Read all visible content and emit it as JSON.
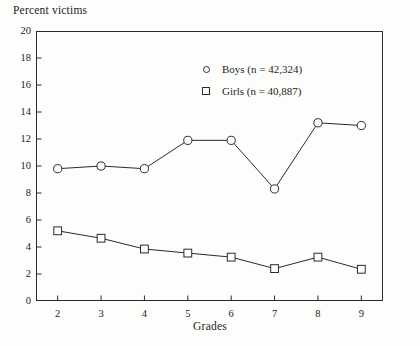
{
  "chart_data": {
    "type": "line",
    "title": "",
    "xlabel": "Grades",
    "ylabel": "Percent victims",
    "categories": [
      "2",
      "3",
      "4",
      "5",
      "6",
      "7",
      "8",
      "9"
    ],
    "x": [
      2,
      3,
      4,
      5,
      6,
      7,
      8,
      9
    ],
    "xlim": [
      1.5,
      9.5
    ],
    "ylim": [
      0,
      20
    ],
    "yticks": [
      "0",
      "2",
      "4",
      "6",
      "8",
      "10",
      "12",
      "14",
      "16",
      "18",
      "20"
    ],
    "ytick_values": [
      0,
      2,
      4,
      6,
      8,
      10,
      12,
      14,
      16,
      18,
      20
    ],
    "grid": false,
    "legend_position": "upper-center",
    "series": [
      {
        "name": "Boys (n = 42,324)",
        "marker": "open-circle",
        "values": [
          9.8,
          10.0,
          9.8,
          11.9,
          11.9,
          8.3,
          13.2,
          13.0
        ]
      },
      {
        "name": "Girls (n = 40,887)",
        "marker": "open-square",
        "values": [
          5.2,
          4.65,
          3.85,
          3.55,
          3.25,
          2.4,
          3.25,
          2.35
        ]
      }
    ]
  },
  "legend": {
    "entries": [
      {
        "label": "Boys (n = 42,324)",
        "marker": "open-circle"
      },
      {
        "label": "Girls (n = 40,887)",
        "marker": "open-square"
      }
    ]
  },
  "colors": {
    "line": "#2b2b2b",
    "axis": "#2b2b2b",
    "background": "#fdfdfc",
    "text": "#1c1c1c"
  }
}
